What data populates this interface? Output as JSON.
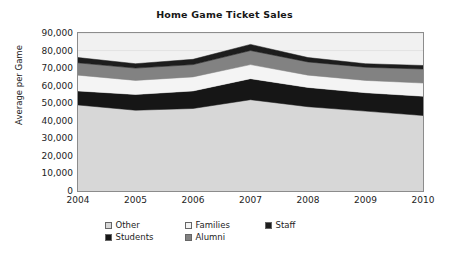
{
  "chart_data": {
    "type": "area",
    "title": "Home Game Ticket Sales",
    "xlabel": "",
    "ylabel": "Average per Game",
    "categories": [
      "2004",
      "2005",
      "2006",
      "2007",
      "2008",
      "2009",
      "2010"
    ],
    "x": [
      2004,
      2005,
      2006,
      2007,
      2008,
      2009,
      2010
    ],
    "ylim": [
      0,
      90000
    ],
    "ytick_labels": [
      "0",
      "10,000",
      "20,000",
      "30,000",
      "40,000",
      "50,000",
      "60,000",
      "70,000",
      "80,000",
      "90,000"
    ],
    "ytick_values": [
      0,
      10000,
      20000,
      30000,
      40000,
      50000,
      60000,
      70000,
      80000,
      90000
    ],
    "grid": true,
    "stacked": true,
    "legend_position": "bottom",
    "series": [
      {
        "name": "Other",
        "color": "#d7d7d7",
        "values": [
          49000,
          46000,
          47000,
          52000,
          48000,
          45500,
          43000
        ]
      },
      {
        "name": "Students",
        "color": "#161616",
        "values": [
          8000,
          9000,
          10000,
          12000,
          11000,
          10500,
          11000
        ]
      },
      {
        "name": "Families",
        "color": "#f4f4f4",
        "values": [
          9000,
          8000,
          8000,
          8000,
          7000,
          7000,
          7500
        ]
      },
      {
        "name": "Alumni",
        "color": "#828282",
        "values": [
          7000,
          7000,
          7000,
          8000,
          7500,
          7500,
          8000
        ]
      },
      {
        "name": "Staff",
        "color": "#1d1d1d",
        "values": [
          3000,
          2500,
          3000,
          3500,
          2500,
          2000,
          2000
        ]
      }
    ],
    "cumulative_tops": {
      "Other": [
        49000,
        46000,
        47000,
        52000,
        48000,
        45500,
        43000
      ],
      "Students": [
        57000,
        55000,
        57000,
        64000,
        59000,
        56000,
        54000
      ],
      "Families": [
        66000,
        63000,
        65000,
        72000,
        66000,
        63000,
        61500
      ],
      "Alumni": [
        73000,
        70000,
        72000,
        80000,
        73500,
        70500,
        69500
      ],
      "Staff": [
        76000,
        72500,
        75000,
        83500,
        76000,
        72500,
        71500
      ]
    }
  },
  "legend": {
    "rows": [
      [
        {
          "label": "Other",
          "color": "#d7d7d7"
        },
        {
          "label": "Families",
          "color": "#f4f4f4"
        },
        {
          "label": "Staff",
          "color": "#1d1d1d"
        }
      ],
      [
        {
          "label": "Students",
          "color": "#161616"
        },
        {
          "label": "Alumni",
          "color": "#828282"
        }
      ]
    ]
  },
  "colors": {
    "plot_background": "#f1f1f1",
    "frame": "#8c8c8c",
    "gridline": "#e2e2e2",
    "text": "#1d1d1d"
  }
}
